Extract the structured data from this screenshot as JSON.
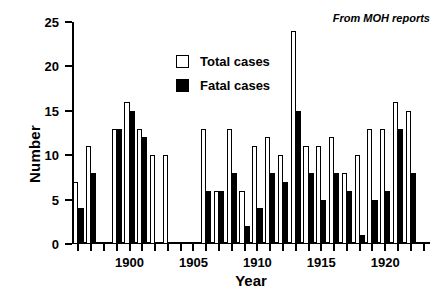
{
  "chart_data": {
    "type": "bar",
    "title": "",
    "xlabel": "Year",
    "ylabel": "Number",
    "ylim": [
      0,
      25
    ],
    "yticks": [
      0,
      5,
      10,
      15,
      20,
      25
    ],
    "xlim": [
      1895.5,
      1923.5
    ],
    "xticks": [
      1896,
      1897,
      1898,
      1899,
      1900,
      1901,
      1902,
      1903,
      1904,
      1905,
      1906,
      1907,
      1908,
      1909,
      1910,
      1911,
      1912,
      1913,
      1914,
      1915,
      1916,
      1917,
      1918,
      1919,
      1920,
      1921,
      1922,
      1923
    ],
    "xticklabels": [
      {
        "value": 1900,
        "label": "1900"
      },
      {
        "value": 1905,
        "label": "1905"
      },
      {
        "value": 1910,
        "label": "1910"
      },
      {
        "value": 1915,
        "label": "1915"
      },
      {
        "value": 1920,
        "label": "1920"
      }
    ],
    "grid": false,
    "legend_position": "upper-left",
    "annotation": "From MOH reports",
    "categories": [
      1896,
      1897,
      1898,
      1899,
      1900,
      1901,
      1902,
      1903,
      1904,
      1905,
      1906,
      1907,
      1908,
      1909,
      1910,
      1911,
      1912,
      1913,
      1914,
      1915,
      1916,
      1917,
      1918,
      1919,
      1920,
      1921,
      1922,
      1923
    ],
    "series": [
      {
        "name": "Total cases",
        "color": "#ffffff",
        "edgecolor": "#000000",
        "values": [
          7,
          11,
          null,
          13,
          16,
          13,
          10,
          10,
          null,
          null,
          13,
          6,
          13,
          6,
          11,
          12,
          10,
          24,
          11,
          11,
          12,
          8,
          10,
          13,
          13,
          16,
          15,
          null
        ]
      },
      {
        "name": "Fatal cases",
        "color": "#000000",
        "edgecolor": "#000000",
        "values": [
          4,
          8,
          null,
          13,
          15,
          12,
          null,
          null,
          null,
          null,
          6,
          6,
          8,
          2,
          4,
          8,
          7,
          15,
          8,
          5,
          8,
          6,
          1,
          5,
          6,
          13,
          8,
          null
        ]
      }
    ]
  },
  "axes": {
    "ylabel": "Number",
    "xlabel": "Year"
  },
  "legend": {
    "items": [
      {
        "label": "Total cases",
        "swatch": "open-square"
      },
      {
        "label": "Fatal cases",
        "swatch": "filled-square"
      }
    ]
  },
  "note": {
    "text": "From MOH reports"
  }
}
